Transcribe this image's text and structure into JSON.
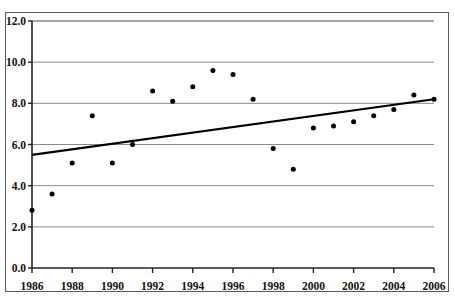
{
  "chart_data": {
    "type": "scatter",
    "title": "",
    "subtitle": "",
    "xlabel": "",
    "ylabel": "",
    "xlim": [
      1986,
      2006
    ],
    "ylim": [
      0.0,
      12.0
    ],
    "grid": true,
    "legend": false,
    "legend_position": "none",
    "x_tick_labels": [
      "1986",
      "1988",
      "1990",
      "1992",
      "1994",
      "1996",
      "1998",
      "2000",
      "2002",
      "2004",
      "2006"
    ],
    "x_tick_values": [
      1986,
      1988,
      1990,
      1992,
      1994,
      1996,
      1998,
      2000,
      2002,
      2004,
      2006
    ],
    "y_tick_labels": [
      "0.0",
      "2.0",
      "4.0",
      "6.0",
      "8.0",
      "10.0",
      "12.0"
    ],
    "y_tick_values": [
      0.0,
      2.0,
      4.0,
      6.0,
      8.0,
      10.0,
      12.0
    ],
    "x": [
      1986,
      1987,
      1988,
      1989,
      1990,
      1991,
      1992,
      1993,
      1994,
      1995,
      1996,
      1997,
      1998,
      1999,
      2000,
      2001,
      2002,
      2003,
      2004,
      2005,
      2006
    ],
    "values": [
      2.8,
      3.6,
      5.1,
      7.4,
      5.1,
      6.0,
      8.6,
      8.1,
      8.8,
      9.6,
      9.4,
      8.2,
      5.8,
      4.8,
      6.8,
      6.9,
      7.1,
      7.4,
      7.7,
      8.4,
      8.2
    ],
    "series": [
      {
        "name": "data-points",
        "type": "scatter",
        "marker": "filled-circle",
        "color": "#000000",
        "values": [
          2.8,
          3.6,
          5.1,
          7.4,
          5.1,
          6.0,
          8.6,
          8.1,
          8.8,
          9.6,
          9.4,
          8.2,
          5.8,
          4.8,
          6.8,
          6.9,
          7.1,
          7.4,
          7.7,
          8.4,
          8.2
        ]
      },
      {
        "name": "trendline",
        "type": "line",
        "color": "#000000",
        "x_endpoints": [
          1986,
          2006
        ],
        "y_endpoints": [
          5.5,
          8.2
        ]
      }
    ],
    "annotations": []
  },
  "axes": {
    "y_axis_name": "y-axis",
    "x_axis_name": "x-axis"
  },
  "frame": {
    "border_color": "#555555",
    "gridline_color": "#888888",
    "plot_background": "#ffffff"
  },
  "colors": {
    "marker": "#000000",
    "trendline": "#000000",
    "grid": "#8a8a8a",
    "border": "#5a5a5a",
    "text": "#111111"
  }
}
